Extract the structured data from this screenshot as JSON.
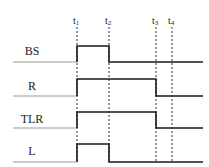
{
  "diagram": {
    "type": "timing-diagram",
    "colors": {
      "trace": "#1a1a1a",
      "axis": "#9a9a9a",
      "marker": "#333333"
    },
    "time_markers": [
      {
        "id": "t1",
        "letter": "t",
        "sub": "1",
        "x": 77
      },
      {
        "id": "t2",
        "letter": "t",
        "sub": "2",
        "x": 109
      },
      {
        "id": "t3",
        "letter": "t",
        "sub": "3",
        "x": 156
      },
      {
        "id": "t4",
        "letter": "t",
        "sub": "4",
        "x": 172
      }
    ],
    "signals": [
      {
        "name": "BS",
        "label_y": 55,
        "baseline_y": 62,
        "high_y": 46,
        "rise": "t1",
        "fall": "t2"
      },
      {
        "name": "R",
        "label_y": 90,
        "baseline_y": 96,
        "high_y": 79,
        "rise": "t1",
        "fall": "t3"
      },
      {
        "name": "TLR",
        "label_y": 123,
        "baseline_y": 128,
        "high_y": 112,
        "rise": "t1",
        "fall": "t3"
      },
      {
        "name": "L",
        "label_y": 155,
        "baseline_y": 162,
        "high_y": 144,
        "rise": "t1",
        "fall": "t2"
      }
    ],
    "axis_x_start": 13,
    "axis_x_end": 203
  }
}
